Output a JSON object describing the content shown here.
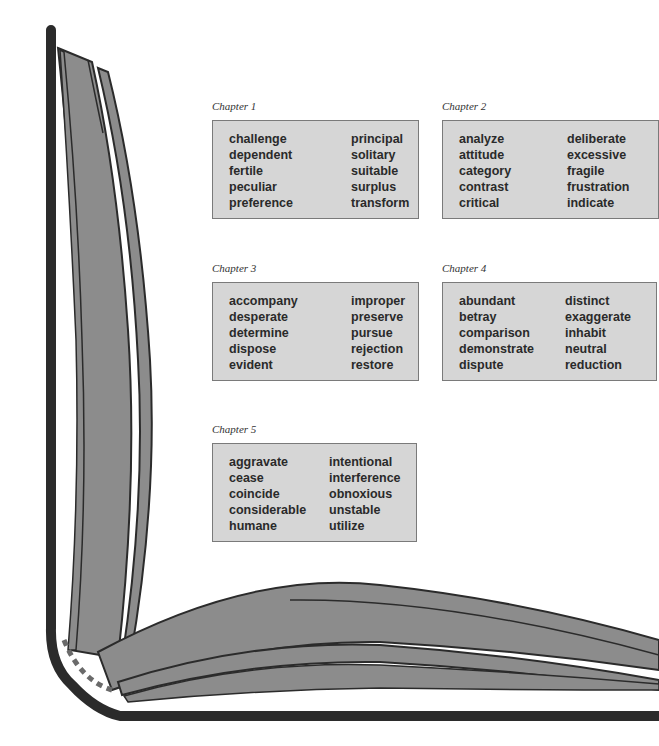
{
  "colors": {
    "box_fill": "#d6d6d6",
    "box_border": "#7a7a7a",
    "book_cover": "#2b2b2b",
    "page_fill": "#8c8c8c",
    "text": "#2a2a2a"
  },
  "chapters": [
    {
      "title": "Chapter 1",
      "col1": [
        "challenge",
        "dependent",
        "fertile",
        "peculiar",
        "preference"
      ],
      "col2": [
        "principal",
        "solitary",
        "suitable",
        "surplus",
        "transform"
      ]
    },
    {
      "title": "Chapter 2",
      "col1": [
        "analyze",
        "attitude",
        "category",
        "contrast",
        "critical"
      ],
      "col2": [
        "deliberate",
        "excessive",
        "fragile",
        "frustration",
        "indicate"
      ]
    },
    {
      "title": "Chapter 3",
      "col1": [
        "accompany",
        "desperate",
        "determine",
        "dispose",
        "evident"
      ],
      "col2": [
        "improper",
        "preserve",
        "pursue",
        "rejection",
        "restore"
      ]
    },
    {
      "title": "Chapter 4",
      "col1": [
        "abundant",
        "betray",
        "comparison",
        "demonstrate",
        "dispute"
      ],
      "col2": [
        "distinct",
        "exaggerate",
        "inhabit",
        "neutral",
        "reduction"
      ]
    },
    {
      "title": "Chapter 5",
      "col1": [
        "aggravate",
        "cease",
        "coincide",
        "considerable",
        "humane"
      ],
      "col2": [
        "intentional",
        "interference",
        "obnoxious",
        "unstable",
        "utilize"
      ]
    }
  ]
}
